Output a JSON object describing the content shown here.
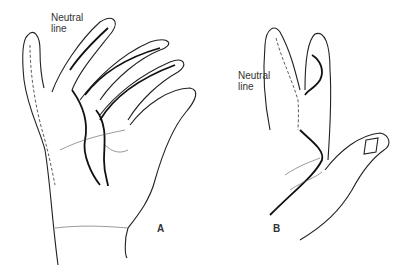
{
  "figure": {
    "panels": [
      {
        "id": "A",
        "label": "A",
        "annotation": {
          "line1": "Neutral",
          "line2": "line"
        }
      },
      {
        "id": "B",
        "label": "B",
        "annotation": {
          "line1": "Neutral",
          "line2": "line"
        }
      }
    ],
    "colors": {
      "ink": "#222222",
      "background": "#ffffff"
    }
  }
}
